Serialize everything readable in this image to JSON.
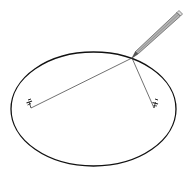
{
  "diagram": {
    "elements": {
      "ellipse": {
        "cx": 93.5,
        "cy": 109,
        "rx": 82.5,
        "ry": 57,
        "stroke": "#111111"
      },
      "foci": [
        {
          "name": "left-pin",
          "x": 31,
          "y": 108
        },
        {
          "name": "right-pin",
          "x": 154,
          "y": 108
        }
      ],
      "string_vertex": {
        "x": 132,
        "y": 58
      },
      "pencil": {
        "tip_x": 132,
        "tip_y": 58,
        "end_x": 181,
        "end_y": 14,
        "color": "#a0a0a0"
      }
    }
  }
}
